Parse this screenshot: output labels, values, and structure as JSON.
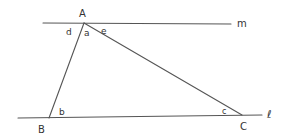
{
  "diagram": {
    "lines": {
      "m": {
        "label": "m"
      },
      "l": {
        "label": "ℓ"
      }
    },
    "vertices": {
      "A": {
        "label": "A"
      },
      "B": {
        "label": "B"
      },
      "C": {
        "label": "C"
      }
    },
    "angles": {
      "a": "a",
      "b": "b",
      "c": "c",
      "d": "d",
      "e": "e"
    }
  }
}
